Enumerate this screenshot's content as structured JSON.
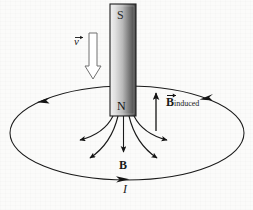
{
  "figure": {
    "background_color": "#fbfbfa",
    "stroke_color": "#1a1a1a"
  },
  "magnet": {
    "name": "bar-magnet",
    "top_pole_label": "S",
    "bottom_pole_label": "N",
    "x": 110,
    "y": 4,
    "width": 26,
    "height": 112,
    "gradient_light": "#f2f2f2",
    "gradient_dark": "#4a4a4a",
    "border_color": "#222222"
  },
  "velocity": {
    "name": "velocity-arrow",
    "label": "v",
    "vector_bar": true,
    "direction": "down",
    "arrow_x": 93,
    "arrow_top": 33,
    "arrow_bottom": 79,
    "style": "hollow-block-arrow",
    "fill": "#ffffff",
    "stroke": "#6d6d6d"
  },
  "induced_field": {
    "name": "b-induced-arrow",
    "label_main": "B",
    "label_sub": "induced",
    "vector_bar": true,
    "direction": "up",
    "arrow_x": 156,
    "arrow_top": 92,
    "arrow_bottom": 131
  },
  "magnetic_field": {
    "name": "b-field-lines",
    "label": "B",
    "center_line_direction": "down",
    "line_count": 5,
    "emergence_y": 116,
    "emergence_x": [
      113,
      118,
      123,
      128,
      133
    ]
  },
  "current_loop": {
    "name": "current-loop-ellipse",
    "label": "I",
    "center_x": 127,
    "center_y": 133,
    "radius_x": 117,
    "radius_y": 47,
    "direction_arrowheads": [
      {
        "position": "upper-left",
        "points": "left"
      },
      {
        "position": "upper-right",
        "points": "left"
      },
      {
        "position": "bottom-center",
        "points": "right"
      }
    ]
  }
}
